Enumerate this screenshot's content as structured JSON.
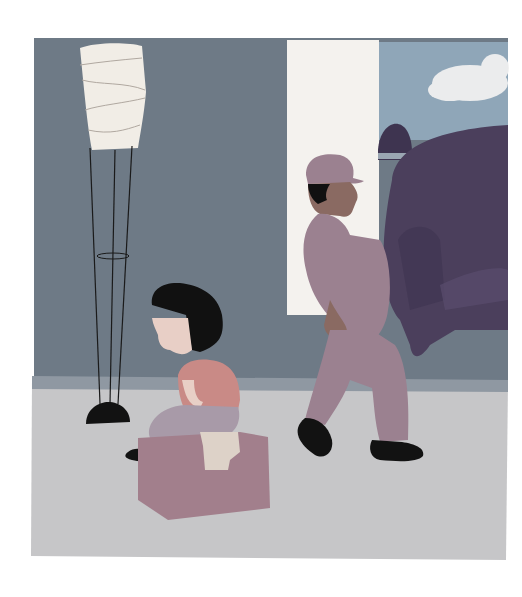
{
  "image": {
    "title": "Illustration: girl sitting on a moving box while a mover carries a sofa",
    "colors": {
      "background": "#ffffff",
      "wall": "#6e7a86",
      "wall_dark_stripe": "#66707c",
      "floor": "#c6c6c8",
      "baseboard": "#8f98a2",
      "column": "#f4f2ee",
      "sky": "#8fa6b8",
      "cloud": "#f0f0f0",
      "sofa": "#4b3f5c",
      "sofa_shadow": "#3e3450",
      "mover_clothes": "#9b8190",
      "mover_skin": "#8a6a62",
      "hair": "#111111",
      "shoes": "#121212",
      "girl_shirt": "#c98a86",
      "girl_pants": "#a89aa8",
      "girl_skin": "#e8cfc6",
      "box": "#a27f8c",
      "box_top": "#b48f9c",
      "tape": "#ddd2c8",
      "lamp_shade": "#f1ede6",
      "lamp_line": "#1a1a1a"
    },
    "elements": [
      "floor-lamp",
      "girl",
      "cardboard-box",
      "mover",
      "sofa",
      "window-column",
      "cloud"
    ]
  }
}
